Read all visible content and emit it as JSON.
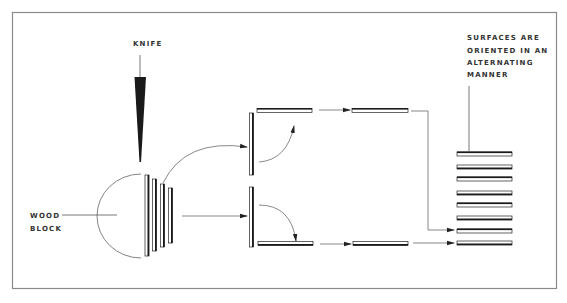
{
  "diagram": {
    "labels": {
      "knife": "KNIFE",
      "wood_block_line1": "WOOD",
      "wood_block_line2": "BLOCK",
      "surfaces_line1": "SURFACES ARE",
      "surfaces_line2": "ORIENTED IN AN",
      "surfaces_line3": "ALTERNATING",
      "surfaces_line4": "MANNER"
    },
    "colors": {
      "frame": "#8a8a8a",
      "line": "#555555",
      "dark": "#1a1a1a",
      "text": "#333333"
    },
    "elements": {
      "knife": "knife blade slicing wood block",
      "wood_block": "half-round wood block",
      "slices_count": 4,
      "stack_count": 8
    }
  }
}
